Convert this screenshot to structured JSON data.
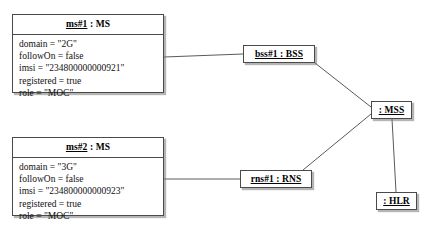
{
  "diagram": {
    "type": "uml-object-diagram",
    "background_color": "#ffffff",
    "line_color": "#555555",
    "border_color": "#4a4a4a"
  },
  "nodes": {
    "ms1": {
      "name": "ms#1",
      "separator": " : ",
      "classifier": "MS",
      "attributes": [
        "domain = \"2G\"",
        "followOn = false",
        "imsi = \"234800000000921\"",
        "registered = true",
        "role = \"MOC\""
      ]
    },
    "ms2": {
      "name": "ms#2",
      "separator": " : ",
      "classifier": "MS",
      "attributes": [
        "domain = \"3G\"",
        "followOn = false",
        "imsi = \"234800000000923\"",
        "registered = true",
        "role = \"MOC\""
      ]
    },
    "bss1": {
      "label": "bss#1 : BSS"
    },
    "rns1": {
      "label": "rns#1 : RNS"
    },
    "mss": {
      "label": ": MSS"
    },
    "hlr": {
      "label": ": HLR"
    }
  },
  "edges": [
    {
      "id": "ms1-bss1",
      "from": "ms1",
      "to": "bss1",
      "x1": 164,
      "y1": 57,
      "x2": 243,
      "y2": 54
    },
    {
      "id": "bss1-mss",
      "from": "bss1",
      "to": "mss",
      "x1": 315,
      "y1": 63,
      "x2": 371,
      "y2": 107
    },
    {
      "id": "mss-rns1",
      "from": "mss",
      "to": "rns1",
      "x1": 371,
      "y1": 114,
      "x2": 303,
      "y2": 170
    },
    {
      "id": "ms2-rns1",
      "from": "ms2",
      "to": "rns1",
      "x1": 164,
      "y1": 179,
      "x2": 240,
      "y2": 179
    },
    {
      "id": "mss-hlr",
      "from": "mss",
      "to": "hlr",
      "x1": 392,
      "y1": 119,
      "x2": 396,
      "y2": 192
    }
  ]
}
